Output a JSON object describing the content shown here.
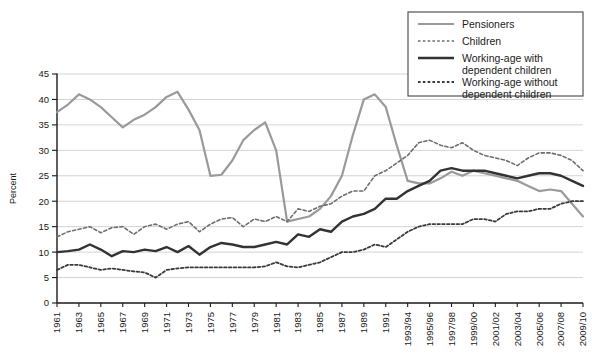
{
  "chart_data": {
    "type": "line",
    "title": "",
    "xlabel": "",
    "ylabel": "Percent",
    "ylim": [
      0,
      45
    ],
    "ytick_step": 5,
    "yticks": [
      0,
      5,
      10,
      15,
      20,
      25,
      30,
      35,
      40,
      45
    ],
    "grid": true,
    "legend_position": "top-right",
    "x": [
      "1961",
      "1962",
      "1963",
      "1964",
      "1965",
      "1966",
      "1967",
      "1968",
      "1969",
      "1970",
      "1971",
      "1972",
      "1973",
      "1974",
      "1975",
      "1976",
      "1977",
      "1978",
      "1979",
      "1980",
      "1981",
      "1982",
      "1983",
      "1984",
      "1985",
      "1986",
      "1987",
      "1988",
      "1989",
      "1990",
      "1991",
      "1992/93",
      "1993/94",
      "1994/95",
      "1995/96",
      "1996/97",
      "1997/98",
      "1998/99",
      "1999/00",
      "2000/01",
      "2001/02",
      "2002/03",
      "2003/04",
      "2004/05",
      "2005/06",
      "2006/07",
      "2007/08",
      "2008/09",
      "2009/10"
    ],
    "xtick_labels": [
      "1961",
      "1963",
      "1965",
      "1967",
      "1969",
      "1971",
      "1973",
      "1975",
      "1977",
      "1979",
      "1981",
      "1983",
      "1985",
      "1987",
      "1989",
      "1991",
      "1993/94",
      "1995/96",
      "1997/98",
      "1999/00",
      "2001/02",
      "2003/04",
      "2005/06",
      "2007/08",
      "2009/10"
    ],
    "series": [
      {
        "name": "Pensioners",
        "style": "solid",
        "color": "#9a9a9a",
        "width": 2.2,
        "values": [
          37.5,
          39.0,
          41.0,
          40.0,
          38.5,
          36.5,
          34.5,
          36.0,
          37.0,
          38.5,
          40.5,
          41.5,
          38.0,
          34.0,
          25.0,
          25.2,
          28.0,
          32.0,
          34.0,
          35.5,
          30.0,
          16.0,
          16.5,
          17.0,
          18.5,
          21.0,
          25.0,
          33.0,
          40.0,
          41.0,
          38.5,
          31.0,
          24.0,
          23.5,
          23.5,
          24.5,
          25.8,
          25.0,
          26.0,
          25.5,
          25.0,
          24.5,
          24.0,
          23.0,
          22.0,
          22.3,
          22.0,
          19.5,
          17.0
        ]
      },
      {
        "name": "Children",
        "style": "dotted",
        "color": "#6e6e6e",
        "width": 1.6,
        "values": [
          13.0,
          14.0,
          14.5,
          15.0,
          13.8,
          14.8,
          15.0,
          13.5,
          15.0,
          15.5,
          14.5,
          15.5,
          16.0,
          14.0,
          15.5,
          16.5,
          16.8,
          15.0,
          16.5,
          16.0,
          17.0,
          16.0,
          18.5,
          18.0,
          19.0,
          19.5,
          21.0,
          22.0,
          22.0,
          25.0,
          26.0,
          27.5,
          29.0,
          31.5,
          32.0,
          31.0,
          30.5,
          31.5,
          30.0,
          29.0,
          28.5,
          28.0,
          27.0,
          28.5,
          29.5,
          29.5,
          29.0,
          28.0,
          26.0
        ]
      },
      {
        "name": "Working-age with dependent children",
        "style": "solid",
        "color": "#333333",
        "width": 2.4,
        "values": [
          10.0,
          10.2,
          10.5,
          11.5,
          10.5,
          9.2,
          10.2,
          10.0,
          10.5,
          10.2,
          11.0,
          10.0,
          11.2,
          9.5,
          11.0,
          11.8,
          11.5,
          11.0,
          11.0,
          11.5,
          12.0,
          11.5,
          13.5,
          13.0,
          14.5,
          14.0,
          16.0,
          17.0,
          17.5,
          18.5,
          20.5,
          20.5,
          22.0,
          23.0,
          24.0,
          26.0,
          26.5,
          26.0,
          26.0,
          26.0,
          25.5,
          25.0,
          24.5,
          25.0,
          25.5,
          25.5,
          25.0,
          24.0,
          23.0
        ]
      },
      {
        "name": "Working-age without dependent children",
        "style": "dotted",
        "color": "#3a3a3a",
        "width": 1.8,
        "values": [
          6.5,
          7.5,
          7.5,
          7.0,
          6.5,
          6.8,
          6.5,
          6.2,
          6.0,
          5.0,
          6.5,
          6.8,
          7.0,
          7.0,
          7.0,
          7.0,
          7.0,
          7.0,
          7.0,
          7.2,
          8.0,
          7.2,
          7.0,
          7.5,
          8.0,
          9.0,
          10.0,
          10.0,
          10.5,
          11.5,
          11.0,
          12.5,
          14.0,
          15.0,
          15.5,
          15.5,
          15.5,
          15.5,
          16.5,
          16.5,
          16.0,
          17.5,
          18.0,
          18.0,
          18.5,
          18.5,
          19.5,
          20.0,
          20.0
        ]
      }
    ]
  },
  "legend": {
    "entries": [
      {
        "label": "Pensioners"
      },
      {
        "label": "Children"
      },
      {
        "label": "Working-age with"
      },
      {
        "label": "dependent children"
      },
      {
        "label": "Working-age without"
      },
      {
        "label": "dependent children"
      }
    ]
  }
}
